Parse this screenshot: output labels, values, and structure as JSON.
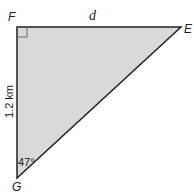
{
  "diagram": {
    "type": "right-triangle",
    "vertices": {
      "F": {
        "label": "F",
        "x": 17,
        "y": 27,
        "right_angle": true
      },
      "E": {
        "label": "E",
        "x": 181,
        "y": 27
      },
      "G": {
        "label": "G",
        "x": 17,
        "y": 178
      }
    },
    "sides": {
      "FE": {
        "label": "d"
      },
      "FG": {
        "label": "1.2 km"
      }
    },
    "angles": {
      "G": {
        "label": "47°"
      }
    },
    "colors": {
      "fill": "#d9d9d9",
      "stroke": "#222222"
    }
  }
}
